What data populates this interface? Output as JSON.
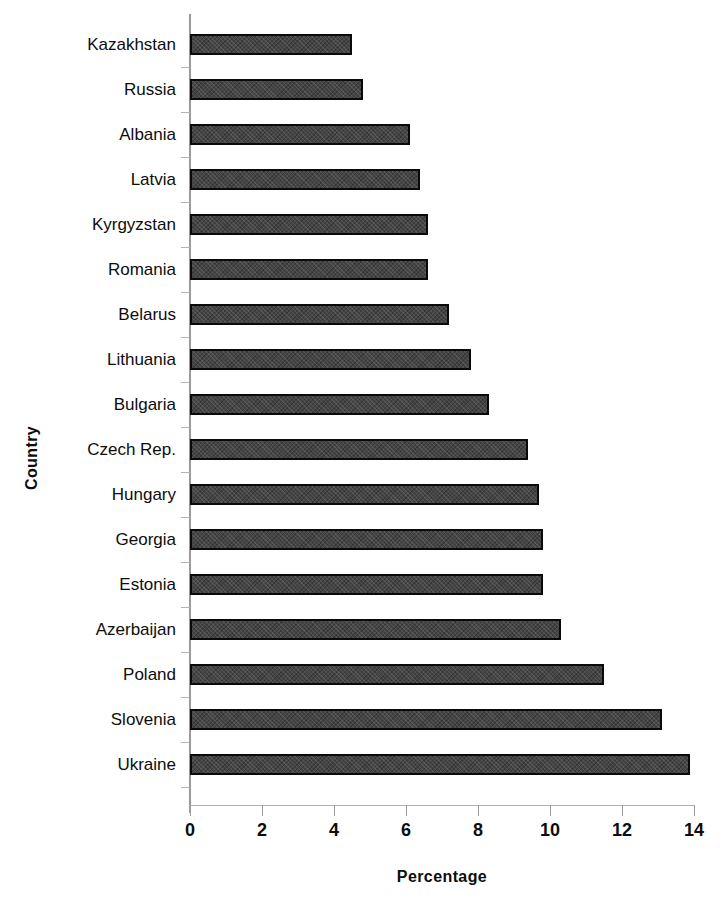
{
  "chart_data": {
    "type": "bar",
    "orientation": "horizontal",
    "title": "",
    "xlabel": "Percentage",
    "ylabel": "Country",
    "xlim": [
      0,
      14
    ],
    "xticks": [
      0,
      2,
      4,
      6,
      8,
      10,
      12,
      14
    ],
    "xtick_labels": [
      "0",
      "2",
      "4",
      "6",
      "8",
      "10",
      "12",
      "14"
    ],
    "grid": false,
    "legend": null,
    "categories": [
      "Kazakhstan",
      "Russia",
      "Albania",
      "Latvia",
      "Kyrgyzstan",
      "Romania",
      "Belarus",
      "Lithuania",
      "Bulgaria",
      "Czech Rep.",
      "Hungary",
      "Georgia",
      "Estonia",
      "Azerbaijan",
      "Poland",
      "Slovenia",
      "Ukraine"
    ],
    "values": [
      4.5,
      4.8,
      6.1,
      6.4,
      6.6,
      6.6,
      7.2,
      7.8,
      8.3,
      9.4,
      9.7,
      9.8,
      9.8,
      10.3,
      11.5,
      13.1,
      13.9
    ],
    "bar_fill_color": "#454545",
    "bar_border_color": "#0a0a0a",
    "background_color": "#ffffff"
  }
}
